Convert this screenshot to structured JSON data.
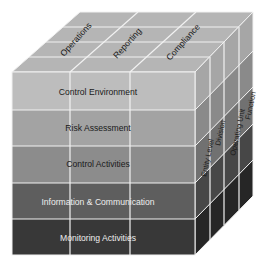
{
  "diagram": {
    "top_labels": [
      "Operations",
      "Reporting",
      "Compliance"
    ],
    "front_rows": [
      {
        "label": "Control Environment",
        "fill": "#bdbdbd",
        "text": "#1a1a1a"
      },
      {
        "label": "Risk Assessment",
        "fill": "#a3a3a3",
        "text": "#1a1a1a"
      },
      {
        "label": "Control Activities",
        "fill": "#8c8c8c",
        "text": "#1a1a1a"
      },
      {
        "label": "Information & Communication",
        "fill": "#5e5e5e",
        "text": "#eeeeee"
      },
      {
        "label": "Monitoring Activities",
        "fill": "#383838",
        "text": "#eeeeee"
      }
    ],
    "side_labels": [
      "Entity Level",
      "Division",
      "Operating Unit",
      "Function"
    ],
    "colors": {
      "top": "#b5b5b5",
      "grid_line": "#f2f2f2",
      "side_rows": [
        "#a6a6a6",
        "#8a8a8a",
        "#717171",
        "#474747",
        "#262626"
      ]
    }
  }
}
